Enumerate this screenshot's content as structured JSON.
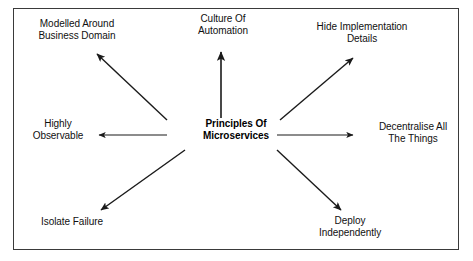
{
  "diagram": {
    "title": "Principles Of Microservices",
    "type": "radial-spoke-diagram",
    "background_color": "#ffffff",
    "frame_color": "#3a3a3a",
    "text_color": "#101010",
    "arrow_color": "#1a1a1a",
    "center": {
      "name": "principles-of-microservices",
      "line1": "Principles Of",
      "line2": "Microservices"
    },
    "nodes": [
      {
        "key": "modelled-around-business-domain",
        "line1": "Modelled Around",
        "line2": "Business Domain",
        "direction": "upper-left"
      },
      {
        "key": "culture-of-automation",
        "line1": "Culture Of",
        "line2": "Automation",
        "direction": "up"
      },
      {
        "key": "hide-implementation-details",
        "line1": "Hide Implementation",
        "line2": "Details",
        "direction": "upper-right"
      },
      {
        "key": "highly-observable",
        "line1": "Highly",
        "line2": "Observable",
        "direction": "left"
      },
      {
        "key": "decentralise-all-the-things",
        "line1": "Decentralise All",
        "line2": "The Things",
        "direction": "right"
      },
      {
        "key": "isolate-failure",
        "line1": "Isolate Failure",
        "line2": "",
        "direction": "lower-left"
      },
      {
        "key": "deploy-independently",
        "line1": "Deploy",
        "line2": "Independently",
        "direction": "lower-right"
      }
    ],
    "arrows": [
      {
        "key": "arrow-upper-left",
        "from": [
          167,
          120
        ],
        "to": [
          95,
          52
        ]
      },
      {
        "key": "arrow-up",
        "from": [
          221,
          118
        ],
        "to": [
          221,
          50
        ]
      },
      {
        "key": "arrow-upper-right",
        "from": [
          280,
          120
        ],
        "to": [
          355,
          56
        ]
      },
      {
        "key": "arrow-left",
        "from": [
          167,
          135
        ],
        "to": [
          97,
          135
        ]
      },
      {
        "key": "arrow-right",
        "from": [
          277,
          135
        ],
        "to": [
          355,
          135
        ]
      },
      {
        "key": "arrow-lower-left",
        "from": [
          185,
          150
        ],
        "to": [
          99,
          212
        ]
      },
      {
        "key": "arrow-lower-right",
        "from": [
          277,
          150
        ],
        "to": [
          343,
          212
        ]
      }
    ]
  }
}
